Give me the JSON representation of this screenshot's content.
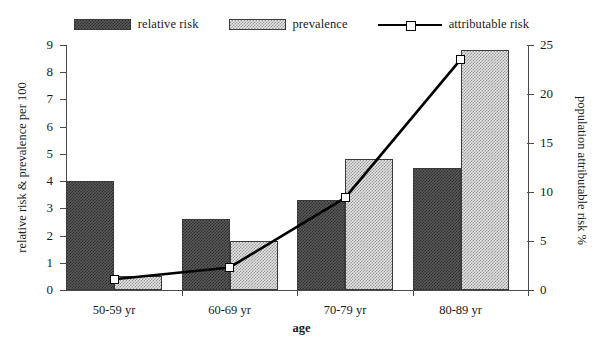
{
  "chart_data": {
    "type": "bar",
    "title": "",
    "xlabel": "age",
    "ylabel": "relative risk & prevalence per 100",
    "y2label": "population attributable risk %",
    "categories": [
      "50-59 yr",
      "60-69 yr",
      "70-79 yr",
      "80-89 yr"
    ],
    "ylim": [
      0,
      9
    ],
    "yticks": [
      0,
      1,
      2,
      3,
      4,
      5,
      6,
      7,
      8,
      9
    ],
    "ytick_labels": [
      "0",
      "1",
      "2",
      "3",
      "4",
      "5",
      "6",
      "7",
      "8",
      "9"
    ],
    "y2lim": [
      0,
      25
    ],
    "y2ticks": [
      0,
      5,
      10,
      15,
      20,
      25
    ],
    "y2tick_labels": [
      "0",
      "5",
      "10",
      "15",
      "20",
      "25"
    ],
    "grid": false,
    "legend_position": "top",
    "series": [
      {
        "name": "relative risk",
        "type": "bar",
        "axis": "left",
        "values": [
          4.0,
          2.6,
          3.3,
          4.5
        ],
        "color": "#4a4a4a",
        "pattern": "dense-checker"
      },
      {
        "name": "prevalence",
        "type": "bar",
        "axis": "left",
        "values": [
          0.5,
          1.8,
          4.8,
          8.8
        ],
        "color": "#c8c8c8",
        "pattern": "light-checker"
      },
      {
        "name": "attributable risk",
        "type": "line",
        "axis": "right",
        "values": [
          1.1,
          2.3,
          9.4,
          23.5
        ],
        "color": "#000000",
        "marker": "open-square"
      }
    ]
  },
  "legend": {
    "items": [
      {
        "label": "relative risk",
        "kind": "swatch",
        "style": "rr"
      },
      {
        "label": "prevalence",
        "kind": "swatch",
        "style": "pv"
      },
      {
        "label": "attributable risk",
        "kind": "line",
        "style": "ln"
      }
    ]
  },
  "axes": {
    "left_title": "relative risk & prevalence per 100",
    "right_title": "population attributable risk %",
    "x_title": "age"
  }
}
